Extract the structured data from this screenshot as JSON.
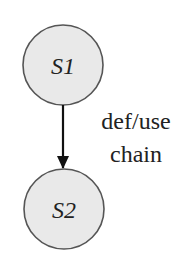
{
  "diagram": {
    "nodes": [
      {
        "id": "S1",
        "label": "S1",
        "cx": 63,
        "cy": 65,
        "r": 40
      },
      {
        "id": "S2",
        "label": "S2",
        "cx": 64,
        "cy": 209,
        "r": 40
      }
    ],
    "edges": [
      {
        "from": "S1",
        "to": "S2",
        "label_line1": "def/use",
        "label_line2": "chain",
        "directed": true
      }
    ],
    "colors": {
      "node_fill": "#e9e9e9",
      "node_stroke": "#555555",
      "edge": "#111111",
      "text": "#222222"
    }
  }
}
